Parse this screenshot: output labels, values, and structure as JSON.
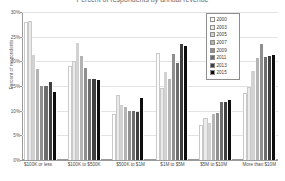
{
  "chart_data": {
    "type": "bar",
    "title": "Percent of respondents by annual revenue",
    "xlabel": "",
    "ylabel": "Percent of respondents",
    "ylim": [
      0,
      30
    ],
    "ytick_labels": [
      "0%",
      "5%",
      "10%",
      "15%",
      "20%",
      "25%",
      "30%"
    ],
    "ytick_values": [
      0,
      5,
      10,
      15,
      20,
      25,
      30
    ],
    "grid": true,
    "legend_position": "top-right",
    "categories": [
      "$100K or less",
      "$100K to $500K",
      "$500K to $1M",
      "$1M to $5M",
      "$5M to $10M",
      "More than $10M"
    ],
    "series": [
      {
        "name": "2000",
        "color": "#fdfdfd",
        "values": [
          28.0,
          19.0,
          9.3,
          21.7,
          7.0,
          13.6
        ]
      },
      {
        "name": "2003",
        "color": "#eaeaea",
        "values": [
          28.2,
          20.0,
          13.2,
          14.5,
          8.6,
          14.8
        ]
      },
      {
        "name": "2005",
        "color": "#d2d2d2",
        "values": [
          21.2,
          23.7,
          11.2,
          17.8,
          7.5,
          18.1
        ]
      },
      {
        "name": "2007",
        "color": "#b4b4b4",
        "values": [
          18.5,
          21.0,
          10.7,
          16.5,
          9.4,
          20.6
        ]
      },
      {
        "name": "2009",
        "color": "#8f8f8f",
        "values": [
          15.0,
          18.7,
          10.0,
          21.4,
          9.6,
          23.5
        ]
      },
      {
        "name": "2011",
        "color": "#6d6d6d",
        "values": [
          15.0,
          16.5,
          10.0,
          19.7,
          11.7,
          20.8
        ]
      },
      {
        "name": "2013",
        "color": "#3f3f3f",
        "values": [
          15.8,
          16.5,
          9.8,
          23.5,
          11.7,
          21.0
        ]
      },
      {
        "name": "2015",
        "color": "#0d0d0d",
        "values": [
          13.8,
          16.3,
          12.6,
          23.1,
          12.1,
          21.2
        ]
      }
    ]
  },
  "axis": {
    "y_label": "Percent of respondents"
  }
}
